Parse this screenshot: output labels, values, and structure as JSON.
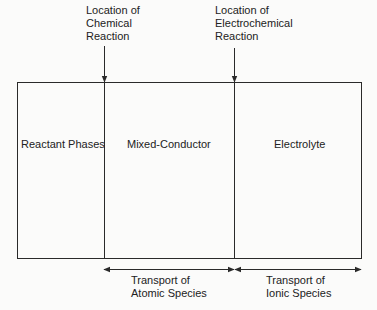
{
  "diagram": {
    "regions": [
      {
        "label": "Reactant Phases"
      },
      {
        "label": "Mixed-Conductor"
      },
      {
        "label": "Electrolyte"
      }
    ],
    "pointers": [
      {
        "label": "Location of\nChemical\nReaction"
      },
      {
        "label": "Location of\nElectrochemical\nReaction"
      }
    ],
    "transport": [
      {
        "label": "Transport of\nAtomic Species"
      },
      {
        "label": "Transport of\nIonic Species"
      }
    ],
    "colors": {
      "line": "#2a2a2a",
      "background": "#fbfbfa",
      "text": "#222222"
    }
  }
}
